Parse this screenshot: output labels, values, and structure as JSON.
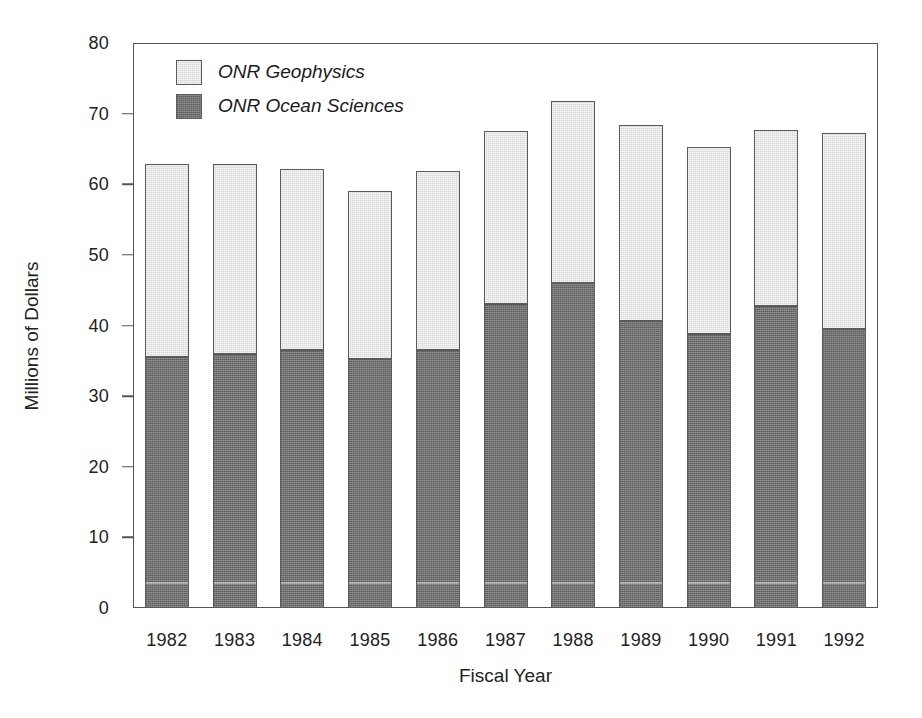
{
  "chart_data": {
    "type": "bar",
    "subtype": "stacked-vertical",
    "title": "",
    "xlabel": "Fiscal Year",
    "ylabel": "Millions of Dollars",
    "categories": [
      "1982",
      "1983",
      "1984",
      "1985",
      "1986",
      "1987",
      "1988",
      "1989",
      "1990",
      "1991",
      "1992"
    ],
    "series": [
      {
        "name": "ONR Ocean Sciences",
        "color": "#6f6f6f",
        "values": [
          35.5,
          36.0,
          36.6,
          35.2,
          36.5,
          43.0,
          46.0,
          40.6,
          38.8,
          42.8,
          39.5
        ]
      },
      {
        "name": "ONR Geophysics",
        "color": "#d6d6d6",
        "values": [
          27.3,
          26.9,
          25.6,
          23.8,
          25.4,
          24.5,
          25.8,
          27.8,
          26.5,
          24.9,
          27.7
        ]
      }
    ],
    "totals": [
      62.8,
      62.9,
      62.2,
      59.0,
      61.9,
      67.5,
      71.8,
      68.4,
      65.3,
      67.7,
      67.2
    ],
    "ylim": [
      0,
      80
    ],
    "yticks": [
      "0",
      "10",
      "20",
      "30",
      "40",
      "50",
      "60",
      "70",
      "80"
    ],
    "ytick_values": [
      0,
      10,
      20,
      30,
      40,
      50,
      60,
      70,
      80
    ],
    "grid": false,
    "legend_position": "top-left",
    "stack_order": [
      "ONR Ocean Sciences",
      "ONR Geophysics"
    ]
  },
  "legend": {
    "items": [
      {
        "label": "ONR Geophysics",
        "color": "#d6d6d6",
        "swatch": "light-gray-swatch"
      },
      {
        "label": "ONR Ocean Sciences",
        "color": "#6f6f6f",
        "swatch": "dark-gray-swatch"
      }
    ]
  }
}
